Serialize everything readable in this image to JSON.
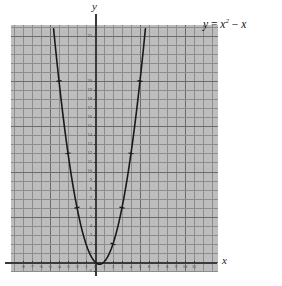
{
  "figure": {
    "equation_text": "y = x² − x",
    "equation_parts": {
      "lhs": "y",
      "equals": "=",
      "var": "x",
      "exponent": "2",
      "minus": "−",
      "linear": "x"
    },
    "x_axis_name": "x",
    "y_axis_name": "y",
    "background_color": "#bdbdbd",
    "grid_minor_color": "#8c8c8c",
    "grid_major_color": "#6b6b6b",
    "axis_color": "#3a3a3a",
    "curve_color": "#1a1a1a",
    "page_background": "#ffffff"
  },
  "chart_data": {
    "type": "line",
    "xlabel": "x",
    "ylabel": "y",
    "xlim": [
      -8.2,
      11.8
    ],
    "ylim": [
      -1.6,
      26.2
    ],
    "grid": true,
    "grid_minor_step_x": 1,
    "grid_major_step_x": 5,
    "grid_minor_step_y": 1,
    "grid_major_step_y": 5,
    "legend": "none",
    "x_tick_labels": [
      "-8",
      "-7",
      "-6",
      "-5",
      "-4",
      "-3",
      "-2",
      "-1",
      "0",
      "1",
      "2",
      "3",
      "4",
      "5",
      "6",
      "7",
      "8",
      "9",
      "10",
      "11"
    ],
    "x_tick_values": [
      -8,
      -7,
      -6,
      -5,
      -4,
      -3,
      -2,
      -1,
      0,
      1,
      2,
      3,
      4,
      5,
      6,
      7,
      8,
      9,
      10,
      11
    ],
    "y_tick_labels": [
      "-1",
      "1",
      "2",
      "3",
      "4",
      "5",
      "6",
      "7",
      "8",
      "9",
      "10",
      "11",
      "12",
      "13",
      "14",
      "15",
      "16",
      "17",
      "18",
      "19",
      "20",
      "25"
    ],
    "y_tick_values": [
      -1,
      1,
      2,
      3,
      4,
      5,
      6,
      7,
      8,
      9,
      10,
      11,
      12,
      13,
      14,
      15,
      16,
      17,
      18,
      19,
      20,
      25
    ],
    "series": [
      {
        "name": "y = x² − x",
        "x": [
          -4.6,
          -4.4,
          -4.2,
          -4.0,
          -3.8,
          -3.6,
          -3.4,
          -3.2,
          -3.0,
          -2.8,
          -2.6,
          -2.4,
          -2.2,
          -2.0,
          -1.8,
          -1.6,
          -1.4,
          -1.2,
          -1.0,
          -0.8,
          -0.6,
          -0.4,
          -0.2,
          0.0,
          0.2,
          0.4,
          0.5,
          0.6,
          0.8,
          1.0,
          1.2,
          1.4,
          1.6,
          1.8,
          2.0,
          2.2,
          2.4,
          2.6,
          2.8,
          3.0,
          3.2,
          3.4,
          3.6,
          3.8,
          4.0,
          4.2,
          4.4,
          4.6,
          4.8,
          5.0,
          5.2,
          5.4,
          5.6
        ],
        "y": [
          25.76,
          23.76,
          21.84,
          20.0,
          18.24,
          16.56,
          14.96,
          13.44,
          12.0,
          10.64,
          9.36,
          8.16,
          7.04,
          6.0,
          5.04,
          4.16,
          3.36,
          2.64,
          2.0,
          1.44,
          0.96,
          0.56,
          0.24,
          0.0,
          -0.16,
          -0.24,
          -0.25,
          -0.24,
          -0.16,
          0.0,
          0.24,
          0.56,
          0.96,
          1.44,
          2.0,
          2.64,
          3.36,
          4.16,
          5.04,
          6.0,
          7.04,
          8.16,
          9.36,
          10.64,
          12.0,
          13.44,
          14.96,
          16.56,
          18.24,
          20.0,
          21.84,
          23.76,
          25.76
        ]
      }
    ],
    "marked_points": [
      {
        "x": -4,
        "y": 20
      },
      {
        "x": -3,
        "y": 12
      },
      {
        "x": -2,
        "y": 6
      },
      {
        "x": 2,
        "y": 2
      },
      {
        "x": 3,
        "y": 6
      },
      {
        "x": 4,
        "y": 12
      },
      {
        "x": 5,
        "y": 20
      }
    ],
    "vertex": {
      "x": 0.5,
      "y": -0.25
    },
    "roots": [
      0,
      1
    ]
  }
}
